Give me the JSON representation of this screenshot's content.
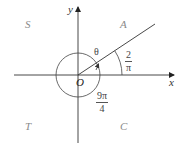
{
  "diagram": {
    "type": "angle-in-standard-position",
    "axes": {
      "x_label": "x",
      "y_label": "y",
      "origin_label": "O"
    },
    "quadrants": {
      "q1": "A",
      "q2": "S",
      "q3": "T",
      "q4": "C"
    },
    "angle_symbol": "θ",
    "reference_angle": {
      "numerator": "2",
      "denominator": "π"
    },
    "rotation_angle": {
      "numerator": "9π",
      "denominator": "4"
    },
    "colors": {
      "line": "#333333",
      "quadrant_text": "#8a8a8a",
      "background": "#ffffff"
    }
  }
}
